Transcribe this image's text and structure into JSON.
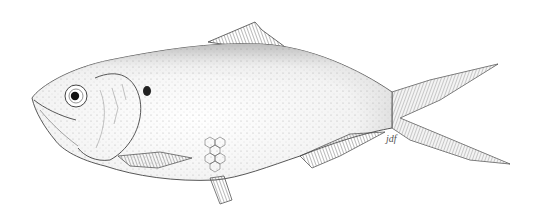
{
  "image": {
    "subject": "Fish illustration (herring/shad), left-facing, stippled pen-and-ink",
    "background": "#ffffff",
    "ink_color": "#333333",
    "signature": "jdf"
  }
}
